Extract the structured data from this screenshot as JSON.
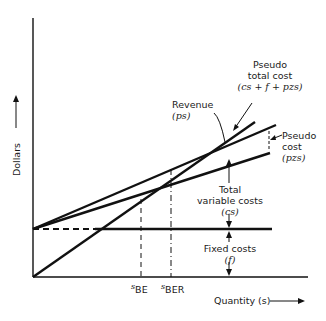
{
  "axes": {
    "y_label": "Dollars",
    "x_label": "Quantity (s)"
  },
  "ticks": {
    "s_be": {
      "base": "s",
      "sub": "BE"
    },
    "s_ber": {
      "base": "s",
      "sub": "BER"
    }
  },
  "labels": {
    "revenue": {
      "title": "Revenue",
      "formula": "(ps)"
    },
    "pseudo_total_cost": {
      "line1": "Pseudo",
      "line2": "total cost",
      "formula": "(cs + f + pzs)"
    },
    "pseudo_cost": {
      "line1": "Pseudo",
      "line2": "cost",
      "formula": "(pzs)"
    },
    "total_variable_costs": {
      "line1": "Total",
      "line2": "variable costs",
      "formula": "(cs)"
    },
    "fixed_costs": {
      "title": "Fixed costs",
      "formula": "(f)"
    }
  },
  "colors": {
    "line": "#111111",
    "background": "#ffffff"
  }
}
